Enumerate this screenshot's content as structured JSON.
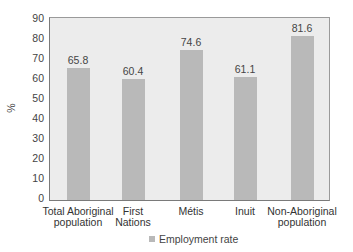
{
  "chart_data": {
    "type": "bar",
    "title": "",
    "xlabel": "",
    "ylabel": "%",
    "ylim": [
      0,
      90
    ],
    "yticks": [
      0,
      10,
      20,
      30,
      40,
      50,
      60,
      70,
      80,
      90
    ],
    "grid": false,
    "legend_position": "bottom",
    "categories": [
      "Total Aboriginal population",
      "First Nations",
      "Métis",
      "Inuit",
      "Non-Aboriginal population"
    ],
    "category_lines": [
      [
        "Total Aboriginal",
        "population"
      ],
      [
        "First",
        "Nations"
      ],
      [
        "Métis",
        ""
      ],
      [
        "Inuit",
        ""
      ],
      [
        "Non-Aboriginal",
        "population"
      ]
    ],
    "series": [
      {
        "name": "Employment rate",
        "values": [
          65.8,
          60.4,
          74.6,
          61.1,
          81.6
        ],
        "labels": [
          "65.8",
          "60.4",
          "74.6",
          "61.1",
          "81.6"
        ],
        "color": "#b9b9b9"
      }
    ]
  },
  "colors": {
    "bar": "#b9b9b9",
    "plot_background": "#ececec",
    "axis": "#7a7a7a"
  }
}
